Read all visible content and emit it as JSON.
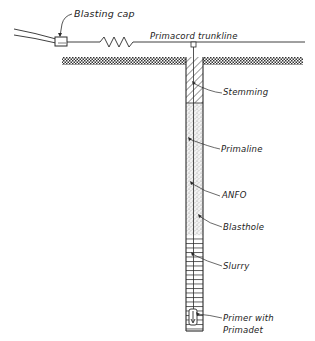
{
  "diagram": {
    "colors": {
      "ink": "#2a2a2a",
      "background": "#ffffff"
    },
    "labels": {
      "blasting_cap": "Blasting cap",
      "trunkline": "Primacord trunkline",
      "stemming": "Stemming",
      "primaline": "Primaline",
      "anfo": "ANFO",
      "blasthole": "Blasthole",
      "slurry": "Slurry",
      "primer_line1": "Primer with",
      "primer_line2": "Primadet"
    },
    "components": [
      {
        "name": "Blasting cap",
        "type": "detonator"
      },
      {
        "name": "Primacord trunkline",
        "type": "detonating cord"
      },
      {
        "name": "Stemming",
        "type": "hole section",
        "fill": "diagonal hatch"
      },
      {
        "name": "Primaline",
        "type": "downline"
      },
      {
        "name": "ANFO",
        "type": "hole section",
        "fill": "stipple"
      },
      {
        "name": "Blasthole",
        "type": "hole wall"
      },
      {
        "name": "Slurry",
        "type": "hole section",
        "fill": "horizontal lines"
      },
      {
        "name": "Primer with Primadet",
        "type": "primer"
      }
    ]
  }
}
